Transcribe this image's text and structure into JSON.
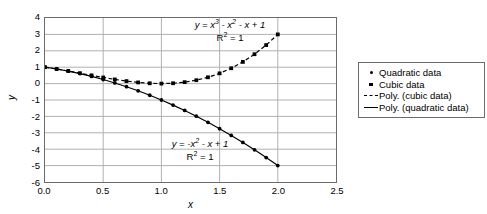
{
  "axes": {
    "x_title": "x",
    "y_title": "y",
    "x_ticks": [
      "0.0",
      "0.5",
      "1.0",
      "1.5",
      "2.0",
      "2.5"
    ],
    "y_ticks": [
      "4",
      "3",
      "2",
      "1",
      "0",
      "-1",
      "-2",
      "-3",
      "-4",
      "-5",
      "-6"
    ]
  },
  "annotations": {
    "cubic": {
      "equation_prefix": "y = x",
      "equation": "y = x³ - x² - x + 1",
      "r2": "R² = 1"
    },
    "quadratic": {
      "equation": "y = -x² - x + 1",
      "r2": "R² = 1"
    }
  },
  "legend": {
    "items": [
      {
        "label": "Quadratic data",
        "marker": "dot-marker"
      },
      {
        "label": "Cubic data",
        "marker": "square-marker"
      },
      {
        "label": "Poly. (cubic data)",
        "marker": "dashed-line-marker"
      },
      {
        "label": "Poly. (quadratic data)",
        "marker": "solid-line-marker"
      }
    ]
  },
  "chart_data": {
    "type": "scatter",
    "title": "",
    "xlabel": "x",
    "ylabel": "y",
    "xlim": [
      0.0,
      2.5
    ],
    "ylim": [
      -6,
      4
    ],
    "xtick_step": 0.5,
    "ytick_step": 1,
    "grid": true,
    "legend_position": "right",
    "annotations": [
      {
        "text": "y = x³ - x² - x + 1",
        "sub": "R² = 1",
        "x": 1.3,
        "y": 3.3
      },
      {
        "text": "y = -x² - x + 1",
        "sub": "R² = 1",
        "x": 1.0,
        "y": -3.3
      }
    ],
    "series": [
      {
        "name": "Quadratic data",
        "marker": "dot",
        "line": "solid",
        "formula": "y = -x^2 - x + 1",
        "x": [
          0.0,
          0.1,
          0.2,
          0.3,
          0.4,
          0.5,
          0.6,
          0.7,
          0.8,
          0.9,
          1.0,
          1.1,
          1.2,
          1.3,
          1.4,
          1.5,
          1.6,
          1.7,
          1.8,
          1.9,
          2.0
        ],
        "values": [
          1.0,
          0.89,
          0.76,
          0.61,
          0.44,
          0.25,
          0.04,
          -0.19,
          -0.44,
          -0.71,
          -1.0,
          -1.31,
          -1.64,
          -1.99,
          -2.36,
          -2.75,
          -3.16,
          -3.59,
          -4.04,
          -4.51,
          -5.0
        ]
      },
      {
        "name": "Cubic data",
        "marker": "square",
        "line": "dashed",
        "formula": "y = x^3 - x^2 - x + 1",
        "x": [
          0.0,
          0.1,
          0.2,
          0.3,
          0.4,
          0.5,
          0.6,
          0.7,
          0.8,
          0.9,
          1.0,
          1.1,
          1.2,
          1.3,
          1.4,
          1.5,
          1.6,
          1.7,
          1.8,
          1.9,
          2.0
        ],
        "values": [
          1.0,
          0.891,
          0.768,
          0.637,
          0.504,
          0.375,
          0.256,
          0.153,
          0.072,
          0.019,
          0.0,
          0.021,
          0.088,
          0.207,
          0.384,
          0.625,
          0.936,
          1.323,
          1.792,
          2.349,
          3.0
        ]
      }
    ]
  }
}
